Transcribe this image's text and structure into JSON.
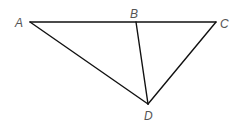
{
  "diagram": {
    "type": "geometry-triangle",
    "colors": {
      "background": "#ffffff",
      "line": "#111111",
      "label": "#555555"
    },
    "points": {
      "A": {
        "x": 30,
        "y": 22,
        "label": "A",
        "label_x": 15,
        "label_y": 27
      },
      "B": {
        "x": 136,
        "y": 22,
        "label": "B",
        "label_x": 130,
        "label_y": 18
      },
      "C": {
        "x": 216,
        "y": 22,
        "label": "C",
        "label_x": 220,
        "label_y": 28
      },
      "D": {
        "x": 148,
        "y": 104,
        "label": "D",
        "label_x": 144,
        "label_y": 120
      }
    },
    "segments": [
      {
        "from": "A",
        "to": "C"
      },
      {
        "from": "A",
        "to": "D"
      },
      {
        "from": "B",
        "to": "D"
      },
      {
        "from": "C",
        "to": "D"
      }
    ]
  }
}
